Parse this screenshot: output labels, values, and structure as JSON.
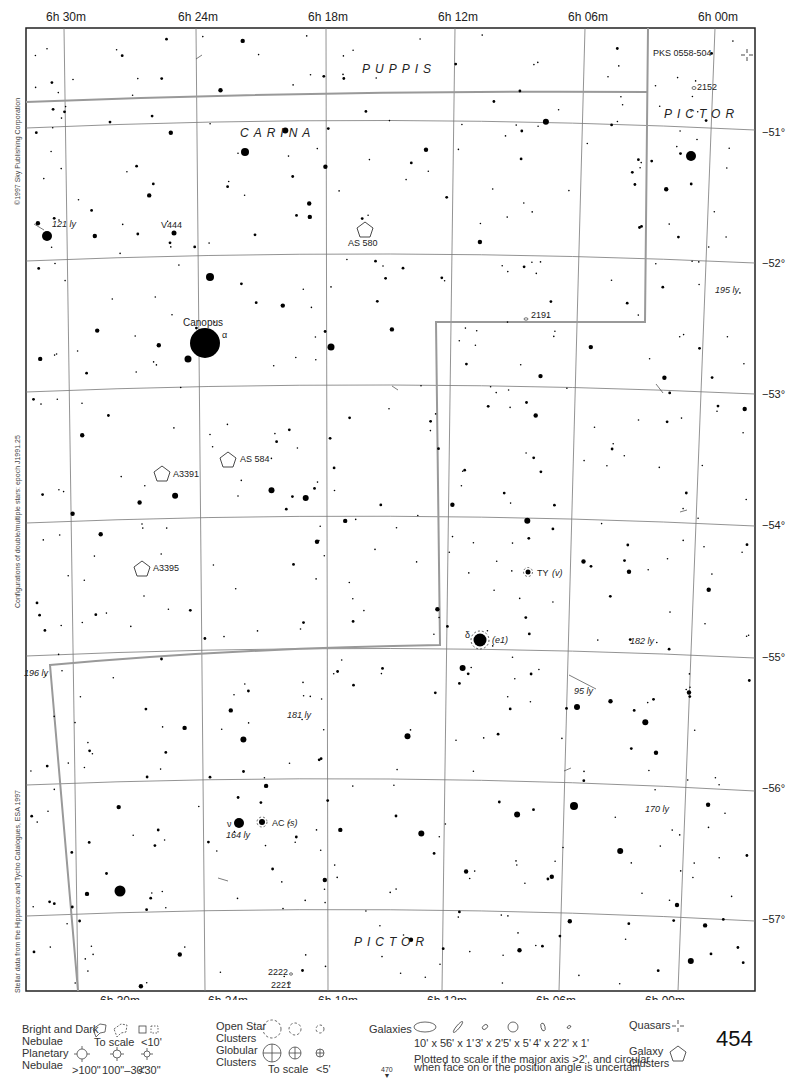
{
  "chart_data": {
    "type": "scatter",
    "ra_labels": [
      "6h 30m",
      "6h 24m",
      "6h 18m",
      "6h 12m",
      "6h 06m",
      "6h 00m"
    ],
    "ra_label_parts": [
      {
        "h": "6",
        "m": "30"
      },
      {
        "h": "6",
        "m": "24"
      },
      {
        "h": "6",
        "m": "18"
      },
      {
        "h": "6",
        "m": "12"
      },
      {
        "h": "6",
        "m": "06"
      },
      {
        "h": "6",
        "m": "00"
      }
    ],
    "dec_labels": [
      "−51°",
      "−52°",
      "−53°",
      "−54°",
      "−55°",
      "−56°",
      "−57°"
    ],
    "ra_range_min": [
      6.54,
      5.97
    ],
    "dec_range_deg": [
      -50.3,
      -57.6
    ],
    "constellations": [
      "PUPPIS",
      "CARINA",
      "PICTOR",
      "PICTOR"
    ],
    "objects": [
      {
        "name": "Canopus",
        "greek": "α",
        "type": "star",
        "mag": -0.7
      },
      {
        "name": "δ",
        "note": "(e1)",
        "type": "double-star"
      },
      {
        "name": "ν",
        "note": "164 ly",
        "type": "star"
      },
      {
        "name": "AC",
        "note": "(s)",
        "type": "double-star"
      },
      {
        "name": "TY",
        "note": "(v)",
        "type": "variable-star"
      },
      {
        "name": "V444",
        "type": "variable-star"
      },
      {
        "name": "AS 580",
        "type": "galaxy-cluster"
      },
      {
        "name": "AS 584",
        "type": "galaxy-cluster"
      },
      {
        "name": "A3391",
        "type": "galaxy-cluster"
      },
      {
        "name": "A3395",
        "type": "galaxy-cluster"
      },
      {
        "name": "PKS 0558-504",
        "type": "quasar"
      },
      {
        "name": "2152",
        "type": "galaxy"
      },
      {
        "name": "2191",
        "type": "galaxy"
      },
      {
        "name": "2222",
        "type": "galaxy"
      },
      {
        "name": "2221",
        "type": "galaxy"
      }
    ],
    "distance_labels": [
      "121 ly",
      "195 ly",
      "196 ly",
      "181 ly",
      "182 ly",
      "95 ly",
      "170 ly",
      "164 ly"
    ]
  },
  "side_texts": [
    "©1997 Sky Publishing Corporation",
    "Configurations of double/multiple stars: epoch J1991.25",
    "Stellar data from the Hipparcos and Tycho Catalogues, ESA 1997"
  ],
  "legend": {
    "bright_dark_nebulae": {
      "label_l1": "Bright and Dark",
      "label_l2": "Nebulae",
      "to_scale": "To scale",
      "small": "<10'"
    },
    "planetary_nebulae": {
      "label_l1": "Planetary",
      "label_l2": "Nebulae",
      "sizes": [
        ">100\"",
        "100\"–30\"",
        "<30\""
      ]
    },
    "open_star_clusters": {
      "label_l1": "Open Star",
      "label_l2": "Clusters"
    },
    "globular_clusters": {
      "label_l1": "Globular",
      "label_l2": "Clusters",
      "to_scale": "To scale",
      "small": "<5'"
    },
    "galaxies": {
      "label": "Galaxies",
      "sizes": [
        "10' x 5'",
        "6' x 1'",
        "3' x 2'",
        "5' x 5'",
        "4' x 2'",
        "2' x 1'"
      ],
      "note_l1": "Plotted to scale if the major axis >2', and circular",
      "note_l2": "when face on or the position angle is uncertain"
    },
    "quasars": {
      "label": "Quasars"
    },
    "galaxy_clusters": {
      "label_l1": "Galaxy",
      "label_l2": "Clusters"
    }
  },
  "page_number": "454",
  "next_page": "470"
}
